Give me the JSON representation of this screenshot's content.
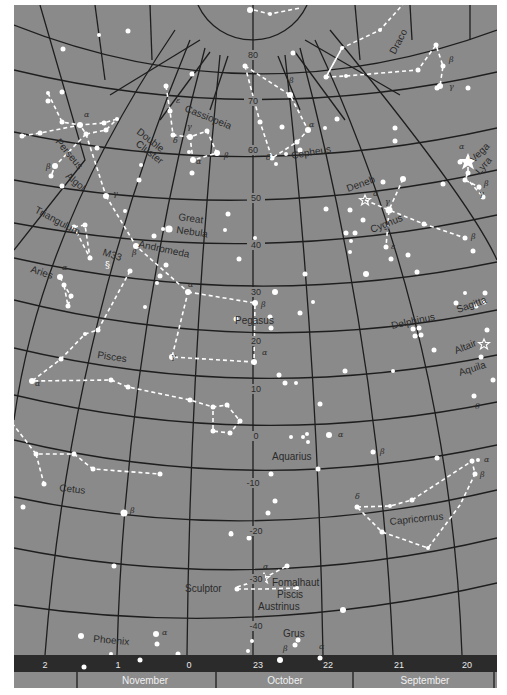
{
  "map": {
    "background_color": "#8a8a8a",
    "grid_color": "#1e1e1e",
    "star_color": "#ffffff",
    "band_color": "#2b2b2b",
    "month_band_color": "#8c8c8c"
  },
  "declination_labels": [
    {
      "id": "d80",
      "text": "80",
      "x": 253,
      "y": 58
    },
    {
      "id": "d70",
      "text": "70",
      "x": 253,
      "y": 104
    },
    {
      "id": "d60",
      "text": "60",
      "x": 253,
      "y": 153
    },
    {
      "id": "d50",
      "text": "50",
      "x": 256,
      "y": 201
    },
    {
      "id": "d40",
      "text": "40",
      "x": 256,
      "y": 248
    },
    {
      "id": "d30",
      "text": "30",
      "x": 256,
      "y": 295
    },
    {
      "id": "d20",
      "text": "20",
      "x": 256,
      "y": 344
    },
    {
      "id": "d10",
      "text": "10",
      "x": 256,
      "y": 392
    },
    {
      "id": "d0",
      "text": "0",
      "x": 256,
      "y": 439
    },
    {
      "id": "dm10",
      "text": "-10",
      "x": 253,
      "y": 486
    },
    {
      "id": "dm20",
      "text": "-20",
      "x": 256,
      "y": 534
    },
    {
      "id": "dm30",
      "text": "-30",
      "x": 256,
      "y": 582
    },
    {
      "id": "dm40",
      "text": "-40",
      "x": 256,
      "y": 629
    }
  ],
  "constellation_labels": [
    {
      "id": "draco",
      "text": "Draco",
      "x": 395,
      "y": 55,
      "rot": -62
    },
    {
      "id": "cassiopeia",
      "text": "Cassiopeia",
      "x": 184,
      "y": 111,
      "rot": 22
    },
    {
      "id": "double-cluster-1",
      "text": "Double",
      "x": 136,
      "y": 133,
      "rot": 38
    },
    {
      "id": "double-cluster-2",
      "text": "Cluster",
      "x": 135,
      "y": 145,
      "rot": 38
    },
    {
      "id": "perseus",
      "text": "Perseus",
      "x": 55,
      "y": 142,
      "rot": 50
    },
    {
      "id": "algol",
      "text": "Algol",
      "x": 65,
      "y": 177,
      "rot": 40
    },
    {
      "id": "cepheus",
      "text": "Cepheus",
      "x": 292,
      "y": 159,
      "rot": -10
    },
    {
      "id": "deneb",
      "text": "Deneb",
      "x": 348,
      "y": 192,
      "rot": -20
    },
    {
      "id": "vega",
      "text": "Vega",
      "x": 474,
      "y": 163,
      "rot": -45
    },
    {
      "id": "lyra",
      "text": "Lyra",
      "x": 480,
      "y": 175,
      "rot": -50
    },
    {
      "id": "cygnus",
      "text": "Cygnus",
      "x": 372,
      "y": 233,
      "rot": -22
    },
    {
      "id": "triangulum",
      "text": "Triangulum",
      "x": 34,
      "y": 212,
      "rot": 28
    },
    {
      "id": "great-nebula-1",
      "text": "Great",
      "x": 178,
      "y": 220,
      "rot": 8
    },
    {
      "id": "great-nebula-2",
      "text": "Nebula",
      "x": 176,
      "y": 233,
      "rot": 8
    },
    {
      "id": "andromeda",
      "text": "Andromeda",
      "x": 138,
      "y": 247,
      "rot": 12
    },
    {
      "id": "m33",
      "text": "M33",
      "x": 102,
      "y": 255,
      "rot": 18
    },
    {
      "id": "aries",
      "text": "Aries",
      "x": 30,
      "y": 272,
      "rot": 18
    },
    {
      "id": "pegasus",
      "text": "Pegasus",
      "x": 235,
      "y": 324,
      "rot": 0
    },
    {
      "id": "delphinus",
      "text": "Delphinus",
      "x": 392,
      "y": 329,
      "rot": -12
    },
    {
      "id": "sagitta",
      "text": "Sagitta",
      "x": 458,
      "y": 313,
      "rot": -20
    },
    {
      "id": "altair",
      "text": "Altair",
      "x": 456,
      "y": 354,
      "rot": -22
    },
    {
      "id": "aquila",
      "text": "Aquila",
      "x": 460,
      "y": 376,
      "rot": -18
    },
    {
      "id": "pisces",
      "text": "Pisces",
      "x": 97,
      "y": 358,
      "rot": 8
    },
    {
      "id": "aquarius",
      "text": "Aquarius",
      "x": 272,
      "y": 460,
      "rot": 0
    },
    {
      "id": "cetus",
      "text": "Cetus",
      "x": 59,
      "y": 491,
      "rot": 6
    },
    {
      "id": "capricornus",
      "text": "Capricornus",
      "x": 390,
      "y": 525,
      "rot": -6
    },
    {
      "id": "fomalhaut",
      "text": "Fomalhaut",
      "x": 272,
      "y": 586,
      "rot": 0
    },
    {
      "id": "piscis",
      "text": "Piscis",
      "x": 277,
      "y": 598,
      "rot": 0
    },
    {
      "id": "austrinus",
      "text": "Austrinus",
      "x": 258,
      "y": 610,
      "rot": 0
    },
    {
      "id": "sculptor",
      "text": "Sculptor",
      "x": 185,
      "y": 592,
      "rot": 0
    },
    {
      "id": "grus",
      "text": "Grus",
      "x": 283,
      "y": 637,
      "rot": 0
    },
    {
      "id": "phoenix",
      "text": "Phoenix",
      "x": 93,
      "y": 642,
      "rot": 5
    }
  ],
  "greek_labels": [
    {
      "id": "g1",
      "text": "α",
      "x": 84,
      "y": 117
    },
    {
      "id": "g2",
      "text": "β",
      "x": 46,
      "y": 169
    },
    {
      "id": "g3",
      "text": "γ",
      "x": 113,
      "y": 196
    },
    {
      "id": "g4",
      "text": "ε",
      "x": 176,
      "y": 103
    },
    {
      "id": "g5",
      "text": "γ",
      "x": 187,
      "y": 129
    },
    {
      "id": "g6",
      "text": "δ",
      "x": 173,
      "y": 143
    },
    {
      "id": "g7",
      "text": "α",
      "x": 196,
      "y": 164
    },
    {
      "id": "g8",
      "text": "β",
      "x": 224,
      "y": 158
    },
    {
      "id": "g9",
      "text": "β",
      "x": 289,
      "y": 83
    },
    {
      "id": "g10",
      "text": "α",
      "x": 309,
      "y": 127
    },
    {
      "id": "g11",
      "text": "δ",
      "x": 266,
      "y": 160
    },
    {
      "id": "g12",
      "text": "β",
      "x": 449,
      "y": 62
    },
    {
      "id": "g13",
      "text": "γ",
      "x": 449,
      "y": 89
    },
    {
      "id": "g14",
      "text": "α",
      "x": 459,
      "y": 149
    },
    {
      "id": "g15",
      "text": "β",
      "x": 484,
      "y": 186
    },
    {
      "id": "g16",
      "text": "γ",
      "x": 479,
      "y": 196
    },
    {
      "id": "g17",
      "text": "α",
      "x": 373,
      "y": 196
    },
    {
      "id": "g18",
      "text": "γ",
      "x": 385,
      "y": 204
    },
    {
      "id": "g19",
      "text": "ε",
      "x": 391,
      "y": 249
    },
    {
      "id": "g20",
      "text": "β",
      "x": 471,
      "y": 239
    },
    {
      "id": "g21",
      "text": "α",
      "x": 62,
      "y": 270
    },
    {
      "id": "g22",
      "text": "β",
      "x": 132,
      "y": 255
    },
    {
      "id": "g23",
      "text": "α",
      "x": 188,
      "y": 287
    },
    {
      "id": "g24",
      "text": "β",
      "x": 261,
      "y": 307
    },
    {
      "id": "g25",
      "text": "γ",
      "x": 171,
      "y": 359
    },
    {
      "id": "g26",
      "text": "α",
      "x": 262,
      "y": 355
    },
    {
      "id": "g27",
      "text": "α",
      "x": 35,
      "y": 386
    },
    {
      "id": "g28",
      "text": "α",
      "x": 338,
      "y": 437
    },
    {
      "id": "g29",
      "text": "β",
      "x": 380,
      "y": 454
    },
    {
      "id": "g30",
      "text": "α",
      "x": 484,
      "y": 462
    },
    {
      "id": "g31",
      "text": "β",
      "x": 480,
      "y": 477
    },
    {
      "id": "g32",
      "text": "δ",
      "x": 355,
      "y": 499
    },
    {
      "id": "g33",
      "text": "θ",
      "x": 475,
      "y": 409
    },
    {
      "id": "g34",
      "text": "β",
      "x": 130,
      "y": 513
    },
    {
      "id": "g35",
      "text": "α",
      "x": 263,
      "y": 569
    },
    {
      "id": "g36",
      "text": "α",
      "x": 162,
      "y": 635
    },
    {
      "id": "g37",
      "text": "β",
      "x": 283,
      "y": 651
    },
    {
      "id": "g38",
      "text": "α",
      "x": 319,
      "y": 649
    }
  ],
  "hour_band": {
    "labels": [
      {
        "id": "h2",
        "text": "2",
        "x": 45
      },
      {
        "id": "h1",
        "text": "1",
        "x": 118
      },
      {
        "id": "h0",
        "text": "0",
        "x": 189
      },
      {
        "id": "h23",
        "text": "23",
        "x": 258
      },
      {
        "id": "h22",
        "text": "22",
        "x": 328
      },
      {
        "id": "h21",
        "text": "21",
        "x": 399
      },
      {
        "id": "h20",
        "text": "20",
        "x": 467
      }
    ]
  },
  "month_band": {
    "labels": [
      {
        "id": "m-nov",
        "text": "November",
        "x": 145
      },
      {
        "id": "m-oct",
        "text": "October",
        "x": 285
      },
      {
        "id": "m-sep",
        "text": "September",
        "x": 425
      }
    ]
  }
}
